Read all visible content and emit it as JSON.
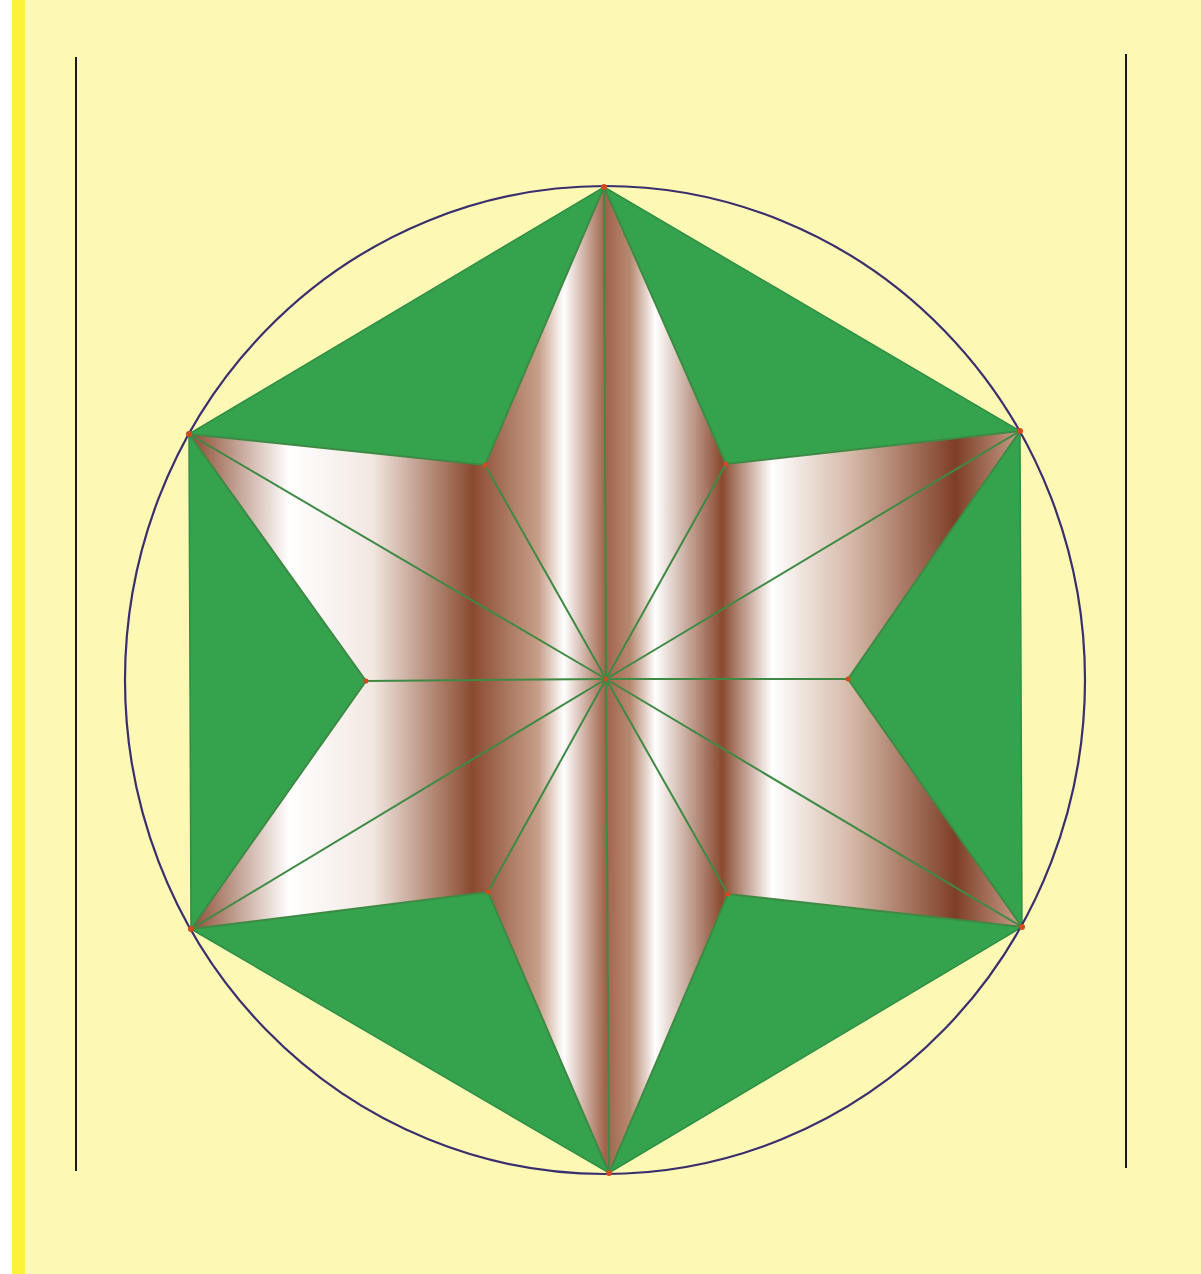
{
  "figure": {
    "colors": {
      "background": "#fdf9b4",
      "margin_stripe": "#fdf23a",
      "hexagon_fill": "#35a24e",
      "star_edge": "#3e8a45",
      "star_dark": "#8a4a30",
      "star_light": "#ffffff",
      "circle_stroke": "#3a2e6e",
      "vertex_dot": "#d24a1e",
      "margin_line": "#1a1a1a"
    },
    "center": [
      606,
      679
    ],
    "circle_radius": 480,
    "outer_vertices": [
      [
        604,
        187
      ],
      [
        1020,
        431
      ],
      [
        1022,
        927
      ],
      [
        609,
        1173
      ],
      [
        191,
        929
      ],
      [
        189,
        434
      ]
    ],
    "inner_vertices": [
      [
        726,
        464
      ],
      [
        848,
        679
      ],
      [
        728,
        894
      ],
      [
        488,
        892
      ],
      [
        366,
        681
      ],
      [
        485,
        465
      ]
    ],
    "margin_lines": {
      "left": {
        "x": 76,
        "y1": 57,
        "y2": 1171
      },
      "right": {
        "x": 1126,
        "y1": 54,
        "y2": 1168
      }
    }
  }
}
